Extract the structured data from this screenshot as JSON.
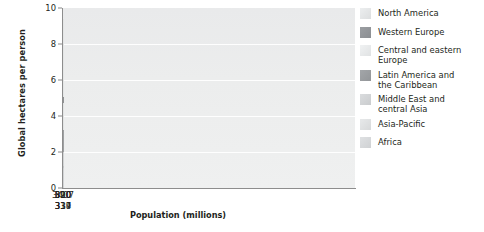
{
  "chart_data": {
    "type": "bar",
    "title": "",
    "xlabel": "Population (millions)",
    "ylabel": "Global hectares per person",
    "ylim": [
      0,
      10
    ],
    "yticks": [
      0,
      2,
      4,
      6,
      8,
      10
    ],
    "gridlines": [
      2,
      4,
      6,
      8
    ],
    "grid": true,
    "legend_position": "right",
    "x_is_population_width": true,
    "categories": [
      "North America",
      "Western Europe",
      "Central and eastern Europe",
      "Latin America and the Caribbean",
      "Middle East and central Asia",
      "Asia-Pacific",
      "Africa"
    ],
    "x_tick_labels": [
      "319",
      "390",
      "337",
      "520",
      "334",
      "3407",
      "810"
    ],
    "populations": [
      319,
      390,
      337,
      520,
      334,
      3407,
      810
    ],
    "values": [
      9.4,
      5.05,
      4.7,
      3.2,
      2.0,
      1.2,
      1.1
    ],
    "bars": [
      {
        "name": "North America",
        "population": "319",
        "value": 9.4,
        "color": "#eef0f0"
      },
      {
        "name": "Western Europe",
        "population": "390",
        "value": 5.05,
        "color": "#9a9c9e"
      },
      {
        "name": "Central and eastern Europe",
        "population": "337",
        "value": 4.7,
        "color": "#eceeee"
      },
      {
        "name": "Latin America and the Caribbean",
        "population": "520",
        "value": 3.2,
        "color": "#a9abad"
      },
      {
        "name": "Middle East and central Asia",
        "population": "334",
        "value": 2.0,
        "color": "#dcdedf"
      },
      {
        "name": "Asia-Pacific",
        "population": "3407",
        "value": 1.2,
        "color": "#d0d2d4"
      },
      {
        "name": "Africa",
        "population": "810",
        "value": 1.1,
        "color": "#dcdee0"
      }
    ]
  },
  "legend": {
    "items": [
      {
        "label": "North America",
        "color": "#e4e6e7"
      },
      {
        "label": "Western Europe",
        "color": "#93969a"
      },
      {
        "label": "Central and eastern\nEurope",
        "color": "#e8eaeb"
      },
      {
        "label": "Latin America and\nthe Caribbean",
        "color": "#9b9ea1"
      },
      {
        "label": "Middle East and\ncentral Asia",
        "color": "#d2d4d6"
      },
      {
        "label": "Asia-Pacific",
        "color": "#dfe1e2"
      },
      {
        "label": "Africa",
        "color": "#d7d9db"
      }
    ]
  },
  "axes": {
    "y_title": "Global hectares per person",
    "x_title": "Population (millions)",
    "y_tick_labels": [
      "0",
      "2",
      "4",
      "6",
      "8",
      "10"
    ]
  }
}
